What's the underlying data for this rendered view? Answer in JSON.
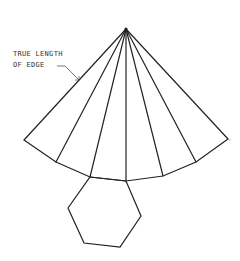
{
  "annotation": {
    "line1": "TRUE LENGTH",
    "line2": "OF EDGE"
  },
  "colors": {
    "stroke": "#222222",
    "background": "#ffffff",
    "text": "#333333"
  },
  "figure": {
    "apex": [
      126,
      29
    ],
    "fan_points": [
      [
        24,
        140
      ],
      [
        56,
        162
      ],
      [
        90,
        177
      ],
      [
        126,
        181
      ],
      [
        163,
        176
      ],
      [
        196,
        162
      ],
      [
        228,
        139
      ]
    ],
    "hexagon": [
      [
        90,
        177
      ],
      [
        126,
        181
      ],
      [
        141,
        216
      ],
      [
        120,
        247
      ],
      [
        84,
        243
      ],
      [
        68,
        208
      ]
    ]
  }
}
